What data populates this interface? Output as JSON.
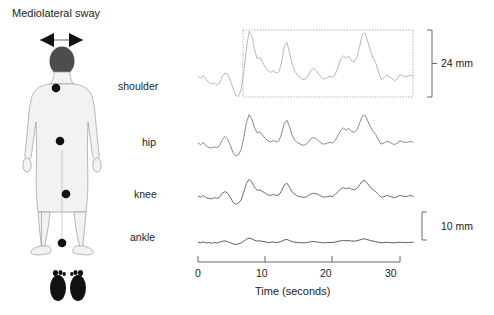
{
  "figure": {
    "title": "Mediolateral sway",
    "arrow_icon": "double-headed-horizontal-arrow",
    "body_diagram": {
      "name": "human-body-posterior-view",
      "markers": [
        "shoulder",
        "hip",
        "knee",
        "ankle"
      ],
      "feet_icon": "footprints-pair"
    }
  },
  "chart_data": {
    "type": "line",
    "title": "Mediolateral sway",
    "xlabel": "Time (seconds)",
    "ylabel": "",
    "xlim": [
      0,
      32
    ],
    "xticks": [
      0,
      10,
      20,
      30
    ],
    "xticklabels": [
      "0",
      "10",
      "20",
      "30"
    ],
    "grid": false,
    "legend": "none",
    "units": "mm",
    "annotations": [
      {
        "name": "shoulder-range-bracket",
        "label": "24 mm",
        "value": 24,
        "applies_to": "shoulder"
      },
      {
        "name": "amplitude-scale-bar",
        "label": "10 mm",
        "value": 10,
        "applies_to": "all"
      }
    ],
    "series": [
      {
        "name": "shoulder",
        "label": "shoulder",
        "color": "#b9b9b9",
        "peak_to_peak_mm": 24,
        "x": [
          0,
          0.4,
          0.8,
          1.2,
          1.6,
          2.0,
          2.4,
          2.8,
          3.2,
          3.6,
          4.0,
          4.4,
          4.8,
          5.2,
          5.6,
          6.0,
          6.4,
          6.8,
          7.2,
          7.6,
          8.0,
          8.4,
          8.8,
          9.2,
          9.6,
          10.0,
          10.4,
          10.8,
          11.2,
          11.6,
          12.0,
          12.4,
          12.8,
          13.2,
          13.6,
          14.0,
          14.4,
          14.8,
          15.2,
          15.6,
          16.0,
          16.4,
          16.8,
          17.2,
          17.6,
          18.0,
          18.4,
          18.8,
          19.2,
          19.6,
          20.0,
          20.4,
          20.8,
          21.2,
          21.6,
          22.0,
          22.4,
          22.8,
          23.2,
          23.6,
          24.0,
          24.4,
          24.8,
          25.2,
          25.6,
          26.0,
          26.4,
          26.8,
          27.2,
          27.6,
          28.0,
          28.4,
          28.8,
          29.2,
          29.6,
          30.0,
          30.4,
          30.8,
          31.2,
          31.6,
          32.0
        ],
        "y": [
          7.5,
          6.6,
          7.8,
          6.4,
          5.2,
          4.6,
          5.0,
          4.3,
          4.9,
          7.4,
          8.6,
          8.2,
          6.0,
          3.2,
          0.6,
          0.2,
          2.5,
          9.0,
          17.5,
          23.6,
          22.0,
          17.0,
          13.6,
          14.2,
          12.4,
          10.6,
          9.4,
          8.8,
          9.4,
          8.6,
          9.0,
          12.0,
          17.8,
          19.6,
          16.0,
          11.6,
          9.2,
          7.8,
          6.9,
          6.2,
          6.4,
          7.8,
          9.6,
          10.2,
          9.4,
          8.0,
          6.8,
          6.4,
          7.0,
          7.4,
          7.0,
          8.2,
          10.8,
          13.6,
          14.8,
          13.8,
          14.6,
          13.0,
          12.6,
          14.2,
          18.0,
          22.4,
          23.0,
          20.0,
          16.6,
          14.0,
          12.2,
          9.0,
          6.2,
          6.8,
          7.8,
          7.4,
          6.6,
          5.8,
          6.6,
          8.0,
          7.6,
          7.2,
          7.6,
          7.8,
          7.4
        ]
      },
      {
        "name": "hip",
        "label": "hip",
        "color": "#8a8a8a",
        "x": [
          0,
          0.4,
          0.8,
          1.2,
          1.6,
          2.0,
          2.4,
          2.8,
          3.2,
          3.6,
          4.0,
          4.4,
          4.8,
          5.2,
          5.6,
          6.0,
          6.4,
          6.8,
          7.2,
          7.6,
          8.0,
          8.4,
          8.8,
          9.2,
          9.6,
          10.0,
          10.4,
          10.8,
          11.2,
          11.6,
          12.0,
          12.4,
          12.8,
          13.2,
          13.6,
          14.0,
          14.4,
          14.8,
          15.2,
          15.6,
          16.0,
          16.4,
          16.8,
          17.2,
          17.6,
          18.0,
          18.4,
          18.8,
          19.2,
          19.6,
          20.0,
          20.4,
          20.8,
          21.2,
          21.6,
          22.0,
          22.4,
          22.8,
          23.2,
          23.6,
          24.0,
          24.4,
          24.8,
          25.2,
          25.6,
          26.0,
          26.4,
          26.8,
          27.2,
          27.6,
          28.0,
          28.4,
          28.8,
          29.2,
          29.6,
          30.0,
          30.4,
          30.8,
          31.2,
          31.6,
          32.0
        ],
        "y": [
          5.0,
          4.4,
          5.2,
          4.0,
          3.4,
          3.2,
          3.6,
          3.4,
          4.0,
          6.2,
          7.4,
          6.4,
          4.2,
          1.6,
          0.4,
          0.8,
          2.6,
          7.0,
          12.4,
          15.2,
          13.6,
          10.4,
          8.6,
          9.0,
          7.8,
          6.6,
          5.8,
          5.4,
          6.0,
          5.4,
          5.8,
          8.2,
          12.0,
          13.2,
          10.8,
          7.6,
          6.0,
          5.0,
          4.6,
          4.2,
          4.4,
          5.4,
          6.6,
          7.0,
          6.4,
          5.6,
          4.8,
          4.6,
          5.0,
          5.2,
          5.0,
          6.0,
          7.8,
          9.6,
          10.4,
          9.6,
          10.2,
          9.2,
          8.8,
          9.8,
          12.2,
          14.6,
          15.0,
          13.0,
          10.8,
          9.2,
          8.0,
          6.2,
          4.6,
          5.0,
          5.6,
          5.4,
          4.8,
          4.4,
          5.0,
          5.8,
          5.4,
          5.2,
          5.4,
          5.6,
          5.2
        ]
      },
      {
        "name": "knee",
        "label": "knee",
        "color": "#6e6e6e",
        "x": [
          0,
          0.4,
          0.8,
          1.2,
          1.6,
          2.0,
          2.4,
          2.8,
          3.2,
          3.6,
          4.0,
          4.4,
          4.8,
          5.2,
          5.6,
          6.0,
          6.4,
          6.8,
          7.2,
          7.6,
          8.0,
          8.4,
          8.8,
          9.2,
          9.6,
          10.0,
          10.4,
          10.8,
          11.2,
          11.6,
          12.0,
          12.4,
          12.8,
          13.2,
          13.6,
          14.0,
          14.4,
          14.8,
          15.2,
          15.6,
          16.0,
          16.4,
          16.8,
          17.2,
          17.6,
          18.0,
          18.4,
          18.8,
          19.2,
          19.6,
          20.0,
          20.4,
          20.8,
          21.2,
          21.6,
          22.0,
          22.4,
          22.8,
          23.2,
          23.6,
          24.0,
          24.4,
          24.8,
          25.2,
          25.6,
          26.0,
          26.4,
          26.8,
          27.2,
          27.6,
          28.0,
          28.4,
          28.8,
          29.2,
          29.6,
          30.0,
          30.4,
          30.8,
          31.2,
          31.6,
          32.0
        ],
        "y": [
          3.2,
          2.8,
          3.4,
          2.6,
          2.4,
          2.2,
          2.6,
          2.4,
          2.8,
          4.2,
          4.8,
          4.2,
          2.8,
          1.0,
          0.3,
          0.6,
          1.8,
          4.6,
          7.8,
          9.2,
          8.2,
          6.4,
          5.2,
          5.4,
          4.8,
          4.2,
          3.6,
          3.4,
          3.8,
          3.4,
          3.6,
          5.0,
          7.2,
          7.8,
          6.4,
          4.6,
          3.8,
          3.2,
          3.0,
          2.8,
          2.8,
          3.4,
          4.0,
          4.2,
          4.0,
          3.6,
          3.0,
          2.8,
          3.0,
          3.2,
          3.0,
          3.8,
          4.8,
          5.8,
          6.2,
          5.8,
          6.2,
          5.6,
          5.4,
          6.0,
          7.2,
          8.6,
          8.8,
          7.6,
          6.4,
          5.4,
          4.8,
          3.8,
          2.8,
          3.0,
          3.4,
          3.2,
          2.8,
          2.6,
          3.0,
          3.4,
          3.2,
          3.0,
          3.2,
          3.4,
          3.0
        ]
      },
      {
        "name": "ankle",
        "label": "ankle",
        "color": "#5c5c5c",
        "x": [
          0,
          0.4,
          0.8,
          1.2,
          1.6,
          2.0,
          2.4,
          2.8,
          3.2,
          3.6,
          4.0,
          4.4,
          4.8,
          5.2,
          5.6,
          6.0,
          6.4,
          6.8,
          7.2,
          7.6,
          8.0,
          8.4,
          8.8,
          9.2,
          9.6,
          10.0,
          10.4,
          10.8,
          11.2,
          11.6,
          12.0,
          12.4,
          12.8,
          13.2,
          13.6,
          14.0,
          14.4,
          14.8,
          15.2,
          15.6,
          16.0,
          16.4,
          16.8,
          17.2,
          17.6,
          18.0,
          18.4,
          18.8,
          19.2,
          19.6,
          20.0,
          20.4,
          20.8,
          21.2,
          21.6,
          22.0,
          22.4,
          22.8,
          23.2,
          23.6,
          24.0,
          24.4,
          24.8,
          25.2,
          25.6,
          26.0,
          26.4,
          26.8,
          27.2,
          27.6,
          28.0,
          28.4,
          28.8,
          29.2,
          29.6,
          30.0,
          30.4,
          30.8,
          31.2,
          31.6,
          32.0
        ],
        "y": [
          1.0,
          0.8,
          1.1,
          0.7,
          0.9,
          0.6,
          0.9,
          0.7,
          1.0,
          1.3,
          1.5,
          1.2,
          0.8,
          0.4,
          0.2,
          0.4,
          0.7,
          1.4,
          2.1,
          2.4,
          2.2,
          1.7,
          1.4,
          1.5,
          1.3,
          1.1,
          0.9,
          1.0,
          1.1,
          0.9,
          1.0,
          1.3,
          1.8,
          2.0,
          1.6,
          1.2,
          1.0,
          0.9,
          0.8,
          0.8,
          0.8,
          1.0,
          1.2,
          1.2,
          1.1,
          1.0,
          0.8,
          0.8,
          0.9,
          0.9,
          0.9,
          1.1,
          1.3,
          1.5,
          1.6,
          1.5,
          1.6,
          1.4,
          1.4,
          1.5,
          1.8,
          2.1,
          2.2,
          1.9,
          1.6,
          1.4,
          1.2,
          1.0,
          0.8,
          0.9,
          1.0,
          0.9,
          0.8,
          0.8,
          0.9,
          1.0,
          0.9,
          0.9,
          0.9,
          1.0,
          0.9
        ]
      }
    ]
  }
}
